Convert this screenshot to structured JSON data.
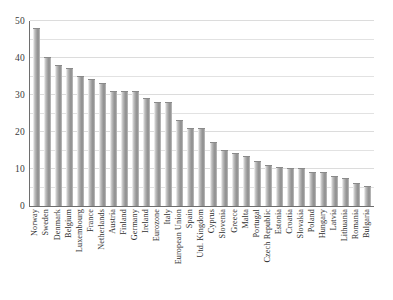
{
  "chart_data": {
    "type": "bar",
    "title": "",
    "subtitle": "",
    "xlabel": "",
    "ylabel": "",
    "ylim": [
      0,
      50
    ],
    "yticks": [
      0,
      10,
      20,
      30,
      40,
      50
    ],
    "ytick_labels": [
      "0",
      "10",
      "20",
      "30",
      "40",
      "50"
    ],
    "gridline_values": [
      5,
      10,
      15,
      20,
      25,
      30,
      35,
      40,
      45,
      50
    ],
    "grid": true,
    "legend": "none",
    "bar_color": "#9a9a9a",
    "axis_color": "#6e6e6e",
    "grid_color": "#e2e2e2",
    "categories": [
      "Norway",
      "Sweden",
      "Denmark",
      "Belgium",
      "Luxembourg",
      "France",
      "Netherlands",
      "Austria",
      "Finland",
      "Germany",
      "Ireland",
      "Eurozone",
      "Italy",
      "European Union",
      "Spain",
      "Utd. Kingdom",
      "Cyprus",
      "Slovenia",
      "Greece",
      "Malta",
      "Portugal",
      "Czech Republic",
      "Estonia",
      "Croatia",
      "Slovakia",
      "Poland",
      "Hungary",
      "Latvia",
      "Lithuania",
      "Romania",
      "Bulgaria"
    ],
    "values": [
      48.0,
      40.2,
      38.2,
      37.2,
      35.1,
      34.2,
      33.2,
      31.1,
      31.1,
      31.1,
      29.2,
      28.2,
      28.2,
      23.2,
      21.1,
      21.1,
      17.2,
      15.1,
      14.2,
      13.6,
      12.2,
      11.2,
      10.5,
      10.2,
      10.2,
      9.2,
      9.2,
      8.2,
      7.6,
      6.2,
      5.5
    ]
  }
}
